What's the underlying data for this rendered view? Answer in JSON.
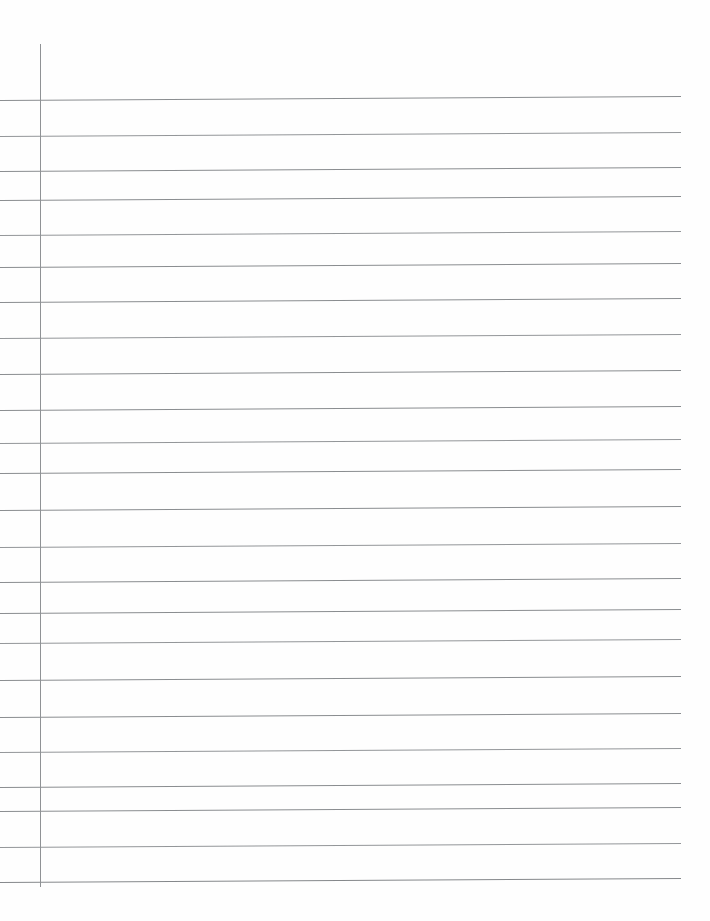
{
  "document": {
    "kind": "scanned-lined-paper",
    "title": "Blank ruled notebook page",
    "page_width": 710,
    "page_height": 921,
    "background_color": "#ffffff",
    "paper_tint": "#fefefe",
    "text_content": "",
    "handwriting_present": false
  },
  "margin_rule": {
    "name": "left margin line",
    "color": "#8f9295",
    "thickness": 1.6,
    "x": 40,
    "y_top": 44,
    "y_bottom": 887
  },
  "ruling": {
    "name": "horizontal ruled lines",
    "color": "#8a8d90",
    "thickness": 1.4,
    "x_start": 0,
    "x_end": 681,
    "tilt_px_over_span": -4,
    "count": 23,
    "y_positions": [
      100,
      136,
      171,
      200,
      235,
      267,
      302,
      338,
      374,
      410,
      443,
      473,
      510,
      547,
      582,
      613,
      643,
      680,
      717,
      752,
      787,
      811,
      847
    ]
  },
  "extra_lines": {
    "bottom_rule_y": 882,
    "bottom_rule_color": "#85888b",
    "bottom_rule_thickness": 1.6
  }
}
